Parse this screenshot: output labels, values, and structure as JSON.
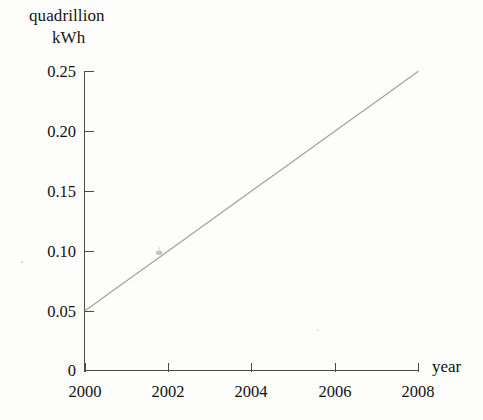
{
  "chart_data": {
    "type": "line",
    "title": "quadrillion kWh",
    "title_lines": [
      "quadrillion",
      "kWh"
    ],
    "xlabel": "year",
    "ylabel": "quadrillion kWh",
    "xlim": [
      2000,
      2008
    ],
    "ylim": [
      0,
      0.25
    ],
    "grid": false,
    "legend": null,
    "x_ticks": [
      "2000",
      "2002",
      "2004",
      "2006",
      "2008"
    ],
    "x_tick_values": [
      2000,
      2002,
      2004,
      2006,
      2008
    ],
    "y_ticks": [
      "0",
      "0.05",
      "0.10",
      "0.15",
      "0.20",
      "0.25"
    ],
    "y_tick_values": [
      0,
      0.05,
      0.1,
      0.15,
      0.2,
      0.25
    ],
    "series": [
      {
        "name": "quadrillion kWh",
        "color": "#a2a2a2",
        "x": [
          2000,
          2001,
          2002,
          2003,
          2004,
          2005,
          2006,
          2007,
          2008
        ],
        "values": [
          0.05,
          0.075,
          0.1,
          0.125,
          0.15,
          0.175,
          0.2,
          0.225,
          0.25
        ]
      }
    ],
    "annotations": [
      {
        "name": "line-marker-speck",
        "x": 2001.78,
        "y": 0.0985,
        "label": ""
      }
    ]
  },
  "axes": {
    "x_axis_label": "year",
    "y_axis_label_line1": "quadrillion",
    "y_axis_label_line2": "kWh"
  }
}
